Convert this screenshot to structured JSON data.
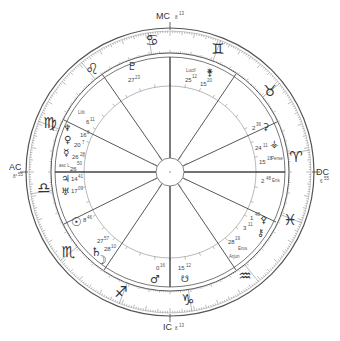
{
  "chart_data": {
    "type": "astrology-natal-wheel",
    "angles": {
      "AC": {
        "label": "AC",
        "degree": "8",
        "minute": "55"
      },
      "MC": {
        "label": "MC",
        "degree": "8",
        "minute": "13"
      },
      "DC": {
        "label": "DC",
        "degree": "6",
        "minute": "55"
      },
      "IC": {
        "label": "IC",
        "degree": "8",
        "minute": "13"
      }
    },
    "signs": [
      {
        "name": "Cancer",
        "glyph": "♋"
      },
      {
        "name": "Gemini",
        "glyph": "♊"
      },
      {
        "name": "Taurus",
        "glyph": "♉"
      },
      {
        "name": "Aries",
        "glyph": "♈"
      },
      {
        "name": "Pisces",
        "glyph": "♓"
      },
      {
        "name": "Aquarius",
        "glyph": "♒"
      },
      {
        "name": "Capricorn",
        "glyph": "♑"
      },
      {
        "name": "Sagittarius",
        "glyph": "♐"
      },
      {
        "name": "Scorpio",
        "glyph": "♏"
      },
      {
        "name": "Libra",
        "glyph": "♎"
      },
      {
        "name": "Virgo",
        "glyph": "♍"
      },
      {
        "name": "Leo",
        "glyph": "♌"
      }
    ],
    "bodies": [
      {
        "name": "Pluto",
        "glyph": "♇",
        "degree": "27",
        "minute": "23"
      },
      {
        "name": "Lilith",
        "label": "Lilit",
        "degree": "6",
        "minute": "11"
      },
      {
        "name": "Neptune",
        "glyph": "♆",
        "degree": "16",
        "minute": "8"
      },
      {
        "name": "Venus",
        "glyph": "♀",
        "degree": "20",
        "minute": "7"
      },
      {
        "name": "Mercury",
        "glyph": "☿",
        "degree": "26",
        "minute": "28"
      },
      {
        "name": "Ascending Lunar Node",
        "label": "asc L",
        "degree": "26",
        "minute": "50"
      },
      {
        "name": "Jupiter",
        "glyph": "♃",
        "degree": "14",
        "minute": "41"
      },
      {
        "name": "Uranus",
        "glyph": "♅",
        "degree": "17",
        "minute": "09"
      },
      {
        "name": "Sun",
        "glyph": "☉",
        "degree": "8",
        "minute": "46"
      },
      {
        "name": "Saturn",
        "glyph": "♄",
        "degree": "27",
        "minute": "57"
      },
      {
        "name": "Moon",
        "glyph": "☽",
        "degree": "28",
        "minute": "10"
      },
      {
        "name": "Mars",
        "glyph": "♂",
        "degree": "0",
        "minute": "16"
      },
      {
        "name": "Descending Lunar Node",
        "glyph": "☋",
        "degree": "15",
        "minute": "12"
      },
      {
        "name": "Arjun",
        "label": "Arjun"
      },
      {
        "name": "Eros",
        "label": "Eros",
        "degree": "28",
        "minute": "19"
      },
      {
        "name": "Chiron",
        "glyph": "⚷",
        "degree": "3",
        "minute": "11"
      },
      {
        "name": "Pallas",
        "glyph": "⚴",
        "degree": "1",
        "minute": "48"
      },
      {
        "name": "Eris",
        "label": "Eris",
        "degree": "2",
        "minute": "48"
      },
      {
        "name": "Persephone",
        "label": "Perse",
        "degree": "15",
        "minute": "18"
      },
      {
        "name": "Vesta",
        "glyph": "⚶",
        "degree": "24",
        "minute": "11"
      },
      {
        "name": "Ceres",
        "glyph": "⚳",
        "degree": "2",
        "minute": "36"
      },
      {
        "name": "Lucifer",
        "label": "Lucif",
        "degree": "25",
        "minute": "12"
      },
      {
        "name": "Juno",
        "glyph": "⚵",
        "degree": "15",
        "minute": "20"
      }
    ]
  },
  "angles": {
    "ac": {
      "label": "AC",
      "sub": "8°",
      "sup": "55"
    },
    "mc": {
      "label": "MC",
      "sub": "8",
      "sup": "13"
    },
    "dc": {
      "label": "DC",
      "sub": "6",
      "sup": "55"
    },
    "ic": {
      "label": "IC",
      "sub": "8",
      "sup": "13"
    }
  },
  "signs": {
    "cancer": "♋",
    "gemini": "♊",
    "taurus": "♉",
    "aries": "♈",
    "pisces": "♓",
    "aquarius": "♒",
    "capricorn": "♑",
    "sagittarius": "♐",
    "scorpio": "♏",
    "libra": "♎",
    "virgo": "♍",
    "leo": "♌"
  },
  "planets": {
    "pluto": {
      "glyph": "♇",
      "deg": "27",
      "min": "23"
    },
    "lilith": {
      "label": "Lilit",
      "deg": "6",
      "min": "11"
    },
    "neptune": {
      "glyph": "♆",
      "deg": "16",
      "min": "8"
    },
    "venus": {
      "glyph": "♀",
      "deg": "20",
      "min": "7"
    },
    "mercury": {
      "glyph": "☿",
      "deg": "26",
      "min": "28"
    },
    "ascnode": {
      "label": "asc L",
      "deg": "26",
      "min": "50"
    },
    "jupiter": {
      "glyph": "♃",
      "deg": "14",
      "min": "41"
    },
    "uranus": {
      "glyph": "♅",
      "deg": "17",
      "min": "09"
    },
    "sun": {
      "glyph": "☉",
      "deg": "8",
      "min": "46"
    },
    "saturn": {
      "glyph": "♄",
      "deg": "27",
      "min": "57"
    },
    "moon": {
      "glyph": "☽",
      "deg": "28",
      "min": "10"
    },
    "mars": {
      "glyph": "♂",
      "deg": "0",
      "min": "16"
    },
    "descnode": {
      "glyph": "☋",
      "deg": "15",
      "min": "12"
    },
    "arjun": {
      "label": "Arjun"
    },
    "eros": {
      "label": "Eros",
      "deg": "28",
      "min": "19"
    },
    "chiron": {
      "glyph": "⚷",
      "deg": "3",
      "min": "11"
    },
    "pallas": {
      "glyph": "⚴",
      "deg": "1",
      "min": "48"
    },
    "eris": {
      "label": "Eris",
      "deg": "2",
      "min": "48"
    },
    "persephone": {
      "label": "Perse",
      "deg": "15",
      "min": "18"
    },
    "vesta": {
      "glyph": "⚶",
      "deg": "24",
      "min": "11"
    },
    "ceres": {
      "glyph": "⚳",
      "deg": "2",
      "min": "36"
    },
    "lucifer": {
      "label": "Lucif",
      "deg": "25",
      "min": "12"
    },
    "juno": {
      "glyph": "⚵",
      "deg": "15",
      "min": "20"
    }
  }
}
